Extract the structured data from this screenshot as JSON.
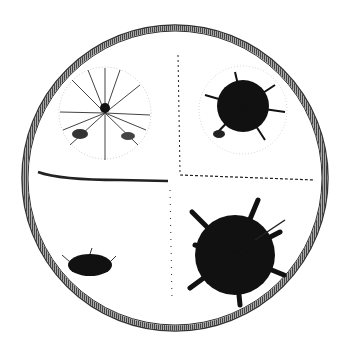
{
  "figure": {
    "dish": {
      "cx": 175,
      "cy": 178,
      "r": 153,
      "ring_color": "#555555"
    },
    "colonies": [
      {
        "name": "top-left",
        "cx": 105,
        "cy": 113,
        "r": 48,
        "density": "light",
        "color": "#333333"
      },
      {
        "name": "top-right",
        "cx": 243,
        "cy": 110,
        "r": 40,
        "density": "dense",
        "color": "#111111"
      },
      {
        "name": "bottom-left",
        "cx": 92,
        "cy": 265,
        "rx": 22,
        "ry": 12,
        "density": "dense",
        "color": "#111111"
      },
      {
        "name": "bottom-right",
        "cx": 235,
        "cy": 250,
        "r": 52,
        "density": "dense",
        "color": "#111111"
      }
    ],
    "dividers": {
      "horizontal_y": 178,
      "vertical_x": 175
    }
  }
}
